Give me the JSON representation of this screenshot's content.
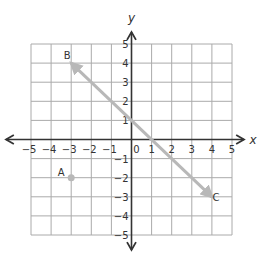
{
  "diagram": {
    "type": "coordinate-plane",
    "x_axis": {
      "label": "x",
      "min": -5,
      "max": 5,
      "ticks": [
        "-5",
        "-4",
        "-3",
        "-2",
        "-1",
        "0",
        "1",
        "2",
        "3",
        "4",
        "5"
      ]
    },
    "y_axis": {
      "label": "y",
      "min": -5,
      "max": 5,
      "ticks": [
        "5",
        "4",
        "3",
        "2",
        "1",
        "-1",
        "-2",
        "-3",
        "-4",
        "-5"
      ]
    },
    "origin_label": "0",
    "grid": true,
    "points": [
      {
        "label": "A",
        "x": -3,
        "y": -2,
        "marker": "dot"
      },
      {
        "label": "B",
        "x": -3,
        "y": 4,
        "marker": "arrowhead"
      },
      {
        "label": "C",
        "x": 4,
        "y": -3,
        "marker": "arrowhead"
      }
    ],
    "line": {
      "through": [
        "B",
        "C"
      ],
      "x_intercept": 1,
      "y_intercept": 1,
      "slope": -1,
      "color": "#b8b8b8",
      "arrows": "both"
    },
    "colors": {
      "grid": "#aaaaaa",
      "axes": "#333333",
      "line": "#b8b8b8",
      "point": "#b8b8b8"
    }
  }
}
